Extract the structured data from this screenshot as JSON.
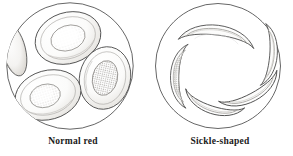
{
  "figure": {
    "type": "scientific-line-illustration",
    "background_color": "#ffffff",
    "ink_color": "#3a3a3a",
    "fill_color": "#fdfdfd",
    "shade_color": "#d8d6d2"
  },
  "panels": [
    {
      "id": "normal",
      "caption": "Normal red",
      "field": {
        "shape": "circle",
        "cx": 70,
        "cy": 66,
        "r": 64
      },
      "cell_shape": "biconcave-disc",
      "cell_count_visible": 4,
      "cells": [
        {
          "name": "cell-top",
          "cx": 68,
          "cy": 38,
          "rx": 33,
          "ry": 25,
          "rotate": -18,
          "dimple_rx": 17,
          "dimple_ry": 12,
          "stipple": "light"
        },
        {
          "name": "cell-right",
          "cx": 105,
          "cy": 78,
          "rx": 25,
          "ry": 31,
          "rotate": 12,
          "dimple_rx": 12,
          "dimple_ry": 17,
          "stipple": "heavy"
        },
        {
          "name": "cell-bottom-left",
          "cx": 48,
          "cy": 95,
          "rx": 33,
          "ry": 24,
          "rotate": -16,
          "dimple_rx": 15,
          "dimple_ry": 11,
          "stipple": "medium"
        },
        {
          "name": "cell-edge-partial",
          "cx": 14,
          "cy": 50,
          "rx": 11,
          "ry": 26,
          "rotate": -14,
          "dimple_rx": 0,
          "dimple_ry": 0,
          "stipple": "none"
        }
      ]
    },
    {
      "id": "sickle",
      "caption": "Sickle-shaped",
      "field": {
        "shape": "circle",
        "cx": 71,
        "cy": 66,
        "r": 63
      },
      "cell_shape": "crescent-sickle",
      "cell_count_visible": 5,
      "arrangement": "pinwheel",
      "cells": [
        {
          "name": "sickle-top",
          "rotate": 8,
          "cx": 70,
          "cy": 36,
          "length": 72,
          "stipple": "light"
        },
        {
          "name": "sickle-right-edge",
          "rotate": 92,
          "cx": 121,
          "cy": 56,
          "length": 58,
          "stipple": "light"
        },
        {
          "name": "sickle-right-lower",
          "rotate": 150,
          "cx": 103,
          "cy": 93,
          "length": 62,
          "stipple": "light"
        },
        {
          "name": "sickle-bottom",
          "rotate": 196,
          "cx": 66,
          "cy": 104,
          "length": 58,
          "stipple": "light"
        },
        {
          "name": "sickle-left",
          "rotate": 268,
          "cx": 33,
          "cy": 75,
          "length": 62,
          "stipple": "heavy"
        }
      ]
    }
  ]
}
